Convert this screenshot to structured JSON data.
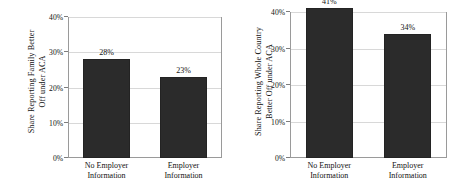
{
  "chart_data": [
    {
      "panel_id": "left",
      "type": "bar",
      "title": "",
      "xlabel": "",
      "ylabel_lines": [
        "Share Reporting Family Better",
        "Off under ACA"
      ],
      "categories": [
        {
          "line1": "No Employer",
          "line2": "Information"
        },
        {
          "line1": "Employer",
          "line2": "Information"
        }
      ],
      "values": [
        28,
        23
      ],
      "value_labels": [
        "28%",
        "23%"
      ],
      "ylim": [
        0,
        40
      ],
      "yticks": [
        0,
        10,
        20,
        30,
        40
      ],
      "ytick_labels": [
        "0%",
        "10%",
        "20%",
        "30%",
        "40%"
      ],
      "grid": true,
      "legend": "none",
      "bar_color": "#2b2b2b"
    },
    {
      "panel_id": "right",
      "type": "bar",
      "title": "",
      "xlabel": "",
      "ylabel_lines": [
        "Share Reporting Whole Country",
        "Better Off under ACA"
      ],
      "categories": [
        {
          "line1": "No Employer",
          "line2": "Information"
        },
        {
          "line1": "Employer",
          "line2": "Information"
        }
      ],
      "values": [
        41,
        34
      ],
      "value_labels": [
        "41%",
        "34%"
      ],
      "ylim": [
        0,
        40
      ],
      "yticks": [
        0,
        10,
        20,
        30,
        40
      ],
      "ytick_labels": [
        "0%",
        "10%",
        "20%",
        "30%",
        "40%"
      ],
      "grid": true,
      "legend": "none",
      "bar_color": "#2b2b2b"
    }
  ],
  "style": {
    "background": "#ffffff",
    "axis_color": "#9a9a9a",
    "grid_color": "#d8d8d8",
    "text_color": "#111111"
  }
}
